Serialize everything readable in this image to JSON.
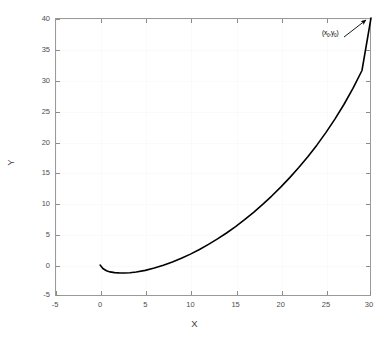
{
  "chart_data": {
    "type": "line",
    "title": "",
    "subtitle": "",
    "xlabel": "X",
    "ylabel": "Y",
    "xlim": [
      -5,
      30
    ],
    "ylim": [
      -5,
      40
    ],
    "xticks": [
      -5,
      0,
      5,
      10,
      15,
      20,
      25,
      30
    ],
    "yticks": [
      -5,
      0,
      5,
      10,
      15,
      20,
      25,
      30,
      35,
      40
    ],
    "xticklabels": [
      "-5",
      "0",
      "5",
      "10",
      "15",
      "20",
      "25",
      "30"
    ],
    "yticklabels": [
      "-5",
      "0",
      "5",
      "10",
      "15",
      "20",
      "25",
      "30",
      "35",
      "40"
    ],
    "grid": true,
    "legend": null,
    "line_color": "#000000",
    "line_width": 1.6,
    "series": [
      {
        "name": "trajectory",
        "x": [
          0.0,
          0.3,
          0.7,
          1.1,
          1.6,
          2.1,
          2.7,
          3.3,
          4.0,
          5.0,
          6.0,
          7.0,
          8.0,
          9.0,
          10.0,
          11.0,
          12.0,
          13.0,
          14.0,
          15.0,
          16.0,
          17.0,
          18.0,
          19.0,
          20.0,
          21.0,
          22.0,
          23.0,
          24.0,
          25.0,
          26.0,
          27.0,
          28.0,
          29.0,
          30.0
        ],
        "y": [
          0.0,
          -0.55,
          -0.92,
          -1.1,
          -1.21,
          -1.26,
          -1.27,
          -1.23,
          -1.12,
          -0.85,
          -0.48,
          -0.03,
          0.5,
          1.1,
          1.78,
          2.53,
          3.35,
          4.24,
          5.2,
          6.24,
          7.35,
          8.55,
          9.82,
          11.18,
          12.62,
          14.16,
          15.8,
          17.55,
          19.42,
          21.45,
          23.63,
          26.0,
          28.6,
          31.5,
          40.0
        ]
      }
    ],
    "annotations": [
      {
        "name": "endpoint-arrow",
        "text": "(x0,y0)",
        "text_base": "(x",
        "sub1": "0",
        "text_mid": ",y",
        "sub2": "0",
        "text_end": ")",
        "points_to_x": 30,
        "points_to_y": 40,
        "arrow_color": "#000000"
      }
    ]
  },
  "axes": {
    "x_title": "X",
    "y_title": "Y"
  },
  "style": {
    "background": "#ffffff",
    "axis_color": "#9a9a9a",
    "tick_label_color": "#4d4d4d",
    "grid_color": "#fafafa"
  }
}
